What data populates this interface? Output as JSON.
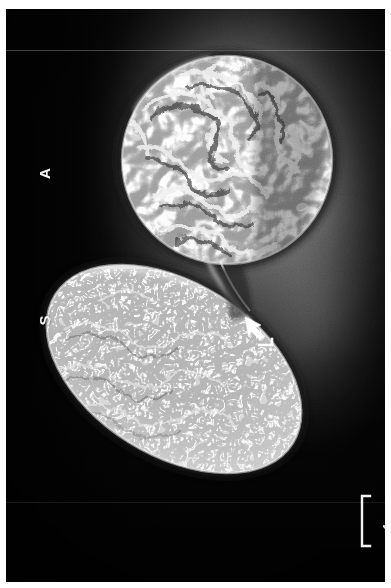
{
  "figure": {
    "type": "scanning-electron-micrograph",
    "background_color": "#070707",
    "border_color": "#ffffff",
    "width": 391,
    "height": 588
  },
  "labels": [
    {
      "id": "ascus",
      "text": "A",
      "color": "#f4f4f4",
      "rotation_deg": -90
    },
    {
      "id": "spore",
      "text": "S",
      "color": "#f4f4f4",
      "rotation_deg": -90
    }
  ],
  "annotations": {
    "arrow": {
      "name": "arrow-marker",
      "color": "#ffffff",
      "direction": "up-left",
      "points_at": "junction between the two cells"
    }
  },
  "scale_bar": {
    "label": "1 µm",
    "color": "#f2f2f2",
    "bracket_style": "square-bracket",
    "rotation_deg": -90
  },
  "specimens": [
    {
      "id": "upper-cell",
      "label": "A",
      "shape": "round, heavily convoluted / wrinkled surface",
      "surface": "deep folded ridges"
    },
    {
      "id": "lower-cell",
      "label": "S",
      "shape": "elongated ovoid, tilted diagonally",
      "surface": "fine worm-like ridges"
    }
  ]
}
